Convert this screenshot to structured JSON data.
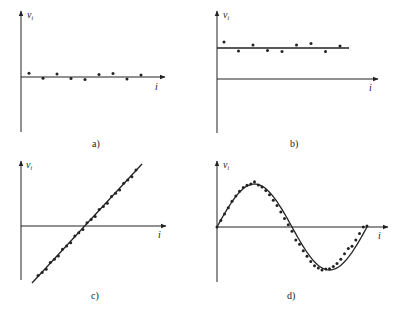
{
  "chart_data": [
    {
      "panel": "a)",
      "type": "scatter",
      "title": "",
      "xlabel": "i",
      "ylabel": "v_i",
      "description": "Residuals randomly scattered about zero",
      "x": [
        1,
        2,
        3,
        4,
        5,
        6,
        7,
        8,
        9
      ],
      "values": [
        0.15,
        -0.05,
        0.12,
        -0.06,
        -0.1,
        0.1,
        0.14,
        -0.08,
        0.08
      ],
      "fit_line": null,
      "grid": false
    },
    {
      "panel": "b)",
      "type": "scatter",
      "title": "",
      "xlabel": "i",
      "ylabel": "v_i",
      "description": "Residuals scattered about a constant nonzero offset",
      "x": [
        1,
        2,
        3,
        4,
        5,
        6,
        7,
        8,
        9
      ],
      "values": [
        1.25,
        0.95,
        1.15,
        0.97,
        0.93,
        1.15,
        1.2,
        0.93,
        1.12
      ],
      "fit_line": {
        "type": "constant",
        "value": 1.05
      },
      "grid": false
    },
    {
      "panel": "c)",
      "type": "scatter",
      "title": "",
      "xlabel": "i",
      "ylabel": "v_i",
      "description": "Residuals following a linear trend",
      "x": [
        1,
        2,
        3,
        4,
        5,
        6,
        7,
        8,
        9,
        10,
        11,
        12,
        13,
        14,
        15,
        16,
        17,
        18,
        19,
        20,
        21,
        22,
        23,
        24,
        25
      ],
      "values": [
        -1.9,
        -1.75,
        -1.6,
        -1.45,
        -1.3,
        -1.15,
        -1.0,
        -0.85,
        -0.7,
        -0.55,
        -0.4,
        -0.25,
        -0.1,
        0.05,
        0.2,
        0.35,
        0.5,
        0.65,
        0.8,
        0.95,
        1.1,
        1.25,
        1.4,
        1.55,
        1.7
      ],
      "fit_line": {
        "type": "linear"
      },
      "grid": false
    },
    {
      "panel": "d)",
      "type": "scatter",
      "title": "",
      "xlabel": "i",
      "ylabel": "v_i",
      "description": "Residuals following a sinusoidal (periodic) pattern",
      "x": [
        0,
        1,
        2,
        3,
        4,
        5,
        6,
        7,
        8,
        9,
        10,
        11,
        12,
        13,
        14,
        15,
        16,
        17,
        18,
        19,
        20,
        21,
        22,
        23,
        24,
        25,
        26,
        27,
        28,
        29,
        30,
        31,
        32,
        33,
        34,
        35,
        36,
        37,
        38,
        39,
        40
      ],
      "values": [
        0.0,
        0.15,
        0.3,
        0.45,
        0.6,
        0.72,
        0.83,
        0.92,
        0.97,
        1.0,
        1.05,
        0.98,
        0.93,
        0.85,
        0.75,
        0.62,
        0.5,
        0.35,
        0.2,
        0.05,
        -0.1,
        -0.3,
        -0.4,
        -0.55,
        -0.68,
        -0.8,
        -0.9,
        -0.95,
        -1.0,
        -0.98,
        -0.97,
        -0.92,
        -0.85,
        -0.75,
        -0.62,
        -0.5,
        -0.45,
        -0.3,
        -0.15,
        0.0,
        0.02
      ],
      "fit_line": {
        "type": "sine"
      },
      "grid": false
    }
  ],
  "labels": {
    "a": "a)",
    "b": "b)",
    "c": "c)",
    "d": "d)",
    "ylabel": "v",
    "ylabel_sub": "i",
    "xlabel": "i"
  }
}
